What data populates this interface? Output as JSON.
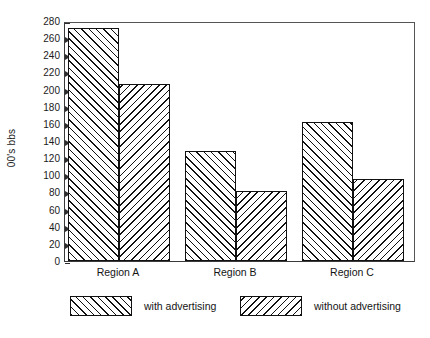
{
  "chart_data": {
    "type": "bar",
    "title": "",
    "xlabel": "",
    "ylabel": "00's bbs",
    "categories": [
      "Region A",
      "Region B",
      "Region C"
    ],
    "series": [
      {
        "name": "with advertising",
        "values": [
          272,
          128,
          162
        ],
        "hatch": "forward-slash"
      },
      {
        "name": "without advertising",
        "values": [
          207,
          82,
          96
        ],
        "hatch": "back-slash"
      }
    ],
    "ylim": [
      0,
      280
    ],
    "ytick_step": 20,
    "yticks": [
      0,
      20,
      40,
      60,
      80,
      100,
      120,
      140,
      160,
      180,
      200,
      220,
      240,
      260,
      280
    ],
    "ytick_labels": [
      "0",
      "20",
      "40",
      "60",
      "80",
      "100",
      "120",
      "140",
      "160",
      "180",
      "200",
      "220",
      "240",
      "260",
      "280"
    ],
    "grid": false,
    "legend_position": "bottom",
    "colors": {
      "bar_fill": "#ffffff",
      "bar_edge": "#111111",
      "hatch": "#111111",
      "axis": "#3a3a3a",
      "text": "#141414",
      "background": "#ffffff"
    }
  },
  "legend": {
    "entries": [
      {
        "label": "with advertising"
      },
      {
        "label": "without advertising"
      }
    ]
  }
}
